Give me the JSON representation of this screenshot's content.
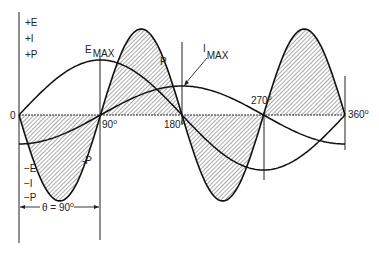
{
  "diagram": {
    "legend_positive": [
      "+E",
      "+I",
      "+P"
    ],
    "legend_negative": [
      "−E",
      "−I",
      "−P"
    ],
    "origin_label": "0",
    "angle_labels": [
      {
        "value": "90",
        "unit": "o"
      },
      {
        "value": "180",
        "unit": "o"
      },
      {
        "value": "270",
        "unit": "o"
      },
      {
        "value": "360",
        "unit": "o"
      }
    ],
    "curve_labels": {
      "e_max": "E",
      "e_max_sub": "MAX",
      "i_max": "I",
      "i_max_sub": "MAX",
      "p_pos": "P",
      "p_neg": "-P"
    },
    "phase_label": "θ = 90",
    "phase_unit": "o",
    "colors": {
      "line": "#111111",
      "hatch": "#555555",
      "background": "#ffffff"
    }
  },
  "chart_data": {
    "type": "line",
    "x": [
      0,
      45,
      90,
      135,
      180,
      225,
      270,
      315,
      360
    ],
    "xlabel": "phase angle (degrees)",
    "series": [
      {
        "name": "E (voltage)",
        "values": [
          0,
          0.71,
          1,
          0.71,
          0,
          -0.71,
          -1,
          -0.71,
          0
        ]
      },
      {
        "name": "I (current, lags 90°)",
        "values": [
          -0.53,
          -0.37,
          0,
          0.37,
          0.53,
          0.37,
          0,
          -0.37,
          -0.53
        ]
      },
      {
        "name": "P (power, shaded)",
        "values": [
          0,
          -1,
          0,
          1,
          0,
          -1,
          0,
          1,
          0
        ]
      }
    ],
    "annotations": [
      "E MAX at 90°",
      "I MAX at 180°",
      "θ = 90°"
    ]
  }
}
